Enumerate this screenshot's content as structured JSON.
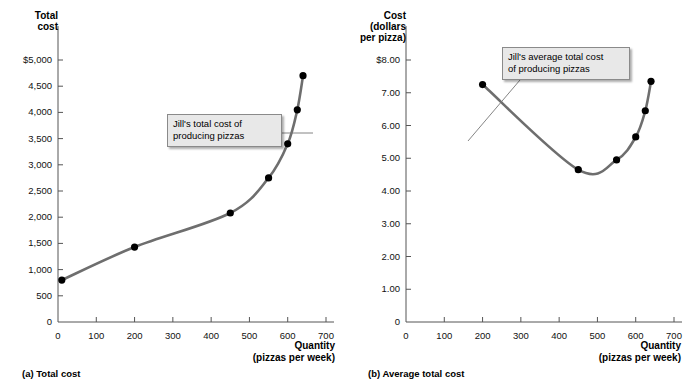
{
  "figure": {
    "panels": [
      {
        "id": "a",
        "subcaption": "(a) Total cost",
        "y_axis_title": "Total\ncost",
        "x_axis_title": "Quantity\n(pizzas per week)",
        "callout": "Jill's total cost of\nproducing pizzas",
        "y_ticks": [
          "$5,000",
          "4,500",
          "4,000",
          "3,500",
          "3,000",
          "2,500",
          "2,000",
          "1,500",
          "1,000",
          "500",
          "0"
        ],
        "x_ticks": [
          "0",
          "100",
          "200",
          "300",
          "400",
          "500",
          "600",
          "700"
        ]
      },
      {
        "id": "b",
        "subcaption": "(b) Average total cost",
        "y_axis_title": "Cost\n(dollars\nper pizza)",
        "x_axis_title": "Quantity\n(pizzas per week)",
        "callout": "Jill's average total cost\nof producing pizzas",
        "y_ticks": [
          "$8.00",
          "7.00",
          "6.00",
          "5.00",
          "4.00",
          "3.00",
          "2.00",
          "1.00",
          "0"
        ],
        "x_ticks": [
          "0",
          "100",
          "200",
          "300",
          "400",
          "500",
          "600",
          "700"
        ]
      }
    ],
    "colors": {
      "curve": "#6e6e6e",
      "point": "#000000",
      "axis": "#555555",
      "callout_bg": "#e8e8e8",
      "callout_border": "#8a8a8a"
    }
  },
  "chart_data": [
    {
      "type": "line",
      "title": "(a) Total cost",
      "xlabel": "Quantity (pizzas per week)",
      "ylabel": "Total cost",
      "xlim": [
        0,
        700
      ],
      "ylim": [
        0,
        5000
      ],
      "grid": false,
      "legend": "none",
      "annotation": "Jill's total cost of producing pizzas",
      "series": [
        {
          "name": "Jill's total cost of producing pizzas",
          "x": [
            10,
            200,
            450,
            550,
            600,
            625,
            640
          ],
          "values": [
            800,
            1430,
            2080,
            2750,
            3400,
            4050,
            4700
          ]
        }
      ],
      "yticks": [
        0,
        500,
        1000,
        1500,
        2000,
        2500,
        3000,
        3500,
        4000,
        4500,
        5000
      ],
      "ytick_labels": [
        "0",
        "500",
        "1,000",
        "1,500",
        "2,000",
        "2,500",
        "3,000",
        "3,500",
        "4,000",
        "4,500",
        "$5,000"
      ],
      "xticks": [
        0,
        100,
        200,
        300,
        400,
        500,
        600,
        700
      ],
      "xtick_labels": [
        "0",
        "100",
        "200",
        "300",
        "400",
        "500",
        "600",
        "700"
      ]
    },
    {
      "type": "line",
      "title": "(b) Average total cost",
      "xlabel": "Quantity (pizzas per week)",
      "ylabel": "Cost (dollars per pizza)",
      "xlim": [
        0,
        700
      ],
      "ylim": [
        0,
        8
      ],
      "grid": false,
      "legend": "none",
      "annotation": "Jill's average total cost of producing pizzas",
      "series": [
        {
          "name": "Jill's average total cost of producing pizzas",
          "x": [
            200,
            450,
            550,
            600,
            625,
            640
          ],
          "values": [
            7.25,
            4.65,
            4.95,
            5.65,
            6.45,
            7.35
          ]
        }
      ],
      "yticks": [
        0,
        1,
        2,
        3,
        4,
        5,
        6,
        7,
        8
      ],
      "ytick_labels": [
        "0",
        "1.00",
        "2.00",
        "3.00",
        "4.00",
        "5.00",
        "6.00",
        "7.00",
        "$8.00"
      ],
      "xticks": [
        0,
        100,
        200,
        300,
        400,
        500,
        600,
        700
      ],
      "xtick_labels": [
        "0",
        "100",
        "200",
        "300",
        "400",
        "500",
        "600",
        "700"
      ]
    }
  ]
}
